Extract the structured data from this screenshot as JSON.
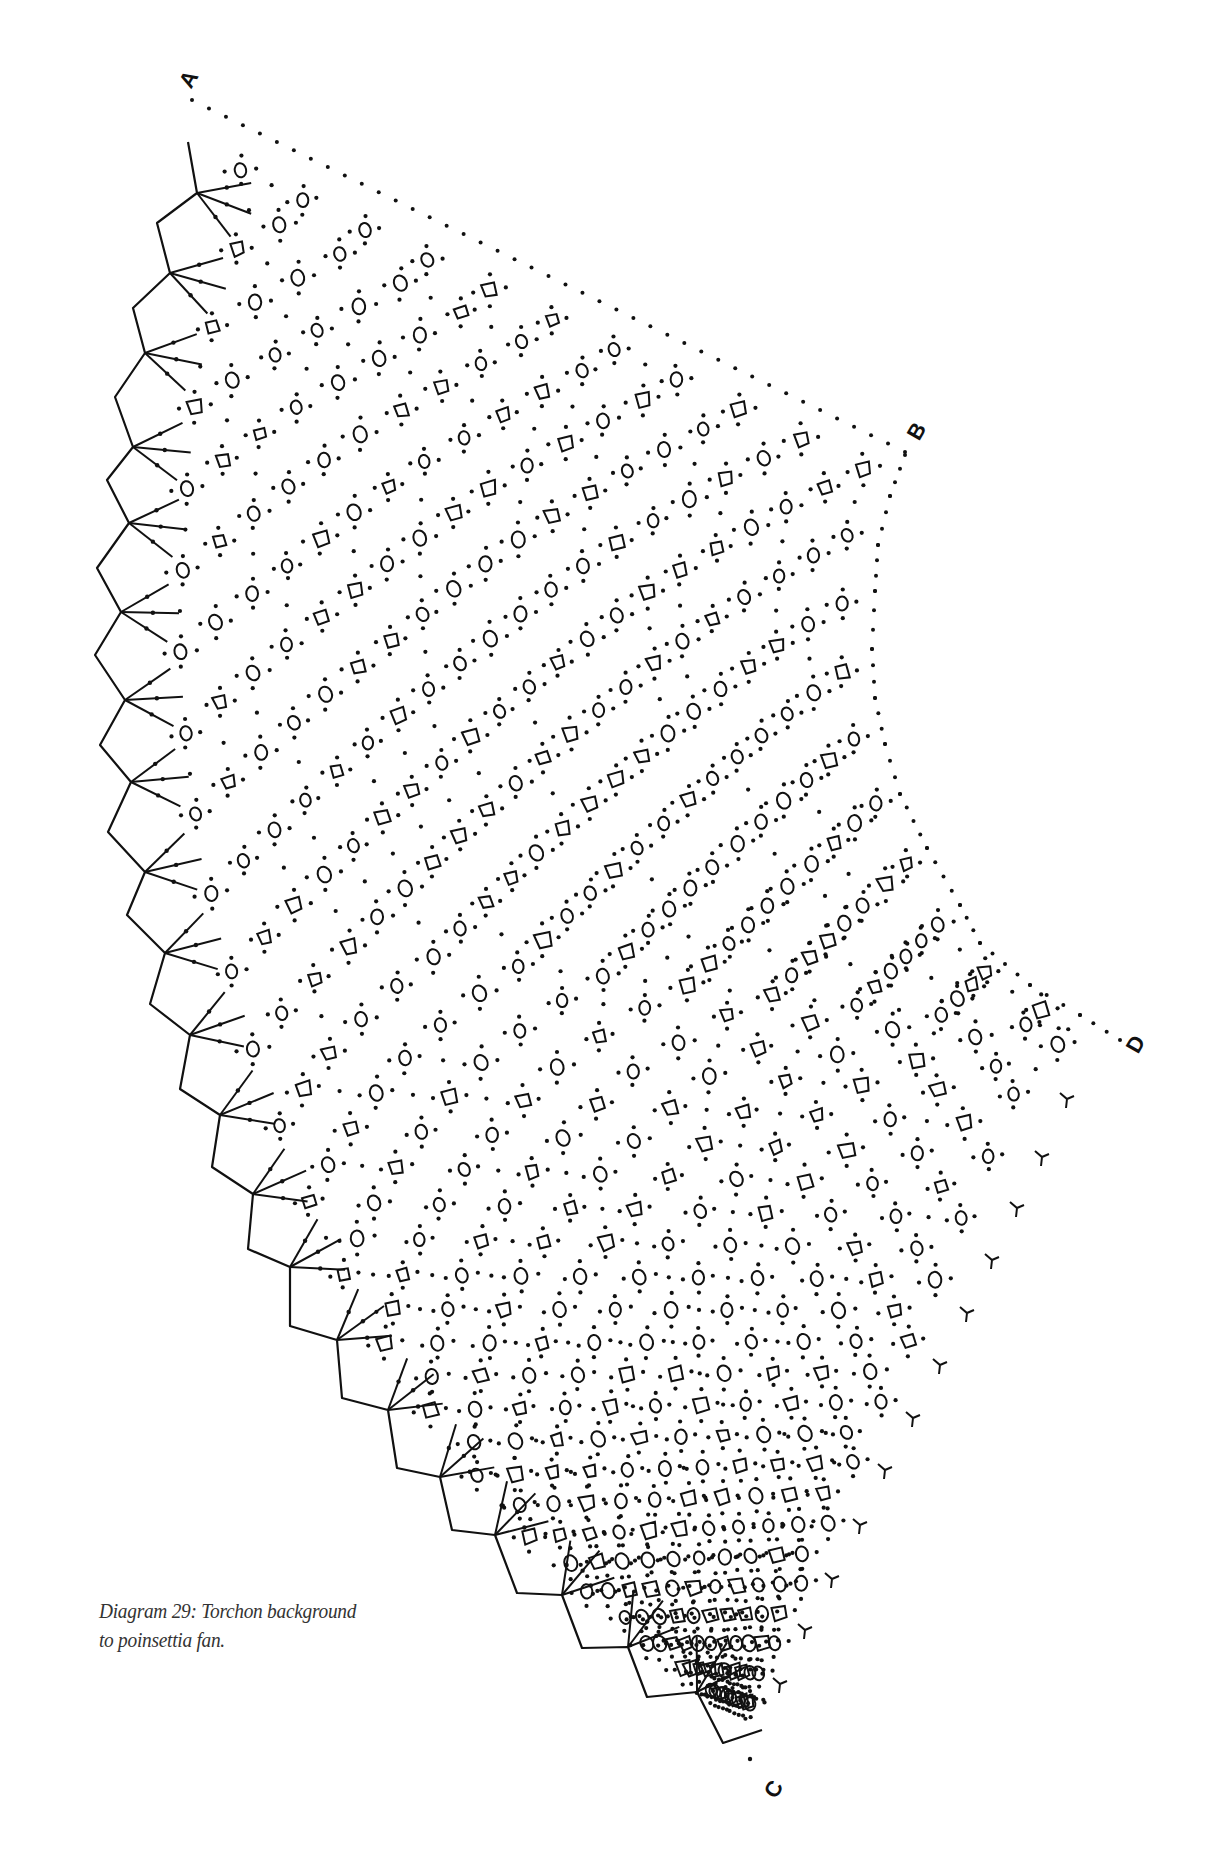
{
  "figure": {
    "caption_line1": "Diagram 29: Torchon background",
    "caption_line2": "to poinsettia fan.",
    "ink_color": "#111111",
    "background": "#ffffff"
  },
  "corner_labels": [
    {
      "id": "A",
      "text": "A",
      "x": 190,
      "y": 80,
      "rotate": -60
    },
    {
      "id": "B",
      "text": "B",
      "x": 918,
      "y": 432,
      "rotate": -60
    },
    {
      "id": "D",
      "text": "D",
      "x": 1137,
      "y": 1045,
      "rotate": -60
    },
    {
      "id": "C",
      "text": "C",
      "x": 775,
      "y": 1790,
      "rotate": -60
    }
  ],
  "left_edge": {
    "picot_tips": [
      [
        197,
        193
      ],
      [
        170,
        273
      ],
      [
        145,
        353
      ],
      [
        133,
        447
      ],
      [
        129,
        523
      ],
      [
        121,
        612
      ],
      [
        125,
        700
      ],
      [
        131,
        782
      ],
      [
        145,
        872
      ],
      [
        165,
        953
      ],
      [
        190,
        1035
      ],
      [
        220,
        1115
      ],
      [
        253,
        1194
      ],
      [
        290,
        1267
      ],
      [
        337,
        1340
      ],
      [
        388,
        1410
      ],
      [
        440,
        1477
      ],
      [
        495,
        1535
      ],
      [
        562,
        1595
      ],
      [
        628,
        1647
      ],
      [
        697,
        1692
      ]
    ],
    "inner_vertices": [
      [
        157,
        223
      ],
      [
        133,
        308
      ],
      [
        115,
        397
      ],
      [
        107,
        480
      ],
      [
        97,
        568
      ],
      [
        95,
        655
      ],
      [
        100,
        745
      ],
      [
        108,
        832
      ],
      [
        127,
        915
      ],
      [
        150,
        1004
      ],
      [
        180,
        1089
      ],
      [
        212,
        1167
      ],
      [
        248,
        1249
      ],
      [
        290,
        1326
      ],
      [
        342,
        1398
      ],
      [
        397,
        1468
      ],
      [
        452,
        1530
      ],
      [
        517,
        1593
      ],
      [
        582,
        1648
      ],
      [
        647,
        1697
      ]
    ],
    "start": [
      188,
      142
    ],
    "end": [
      723,
      1743
    ],
    "tail": [
      762,
      1730
    ],
    "ray_length": 58
  },
  "right_edge": {
    "top_AB": [
      [
        192,
        100
      ],
      [
        905,
        452
      ]
    ],
    "concave_BD": [
      [
        905,
        455
      ],
      [
        890,
        496
      ],
      [
        878,
        545
      ],
      [
        875,
        591
      ],
      [
        872,
        649
      ],
      [
        875,
        698
      ],
      [
        885,
        744
      ],
      [
        900,
        794
      ],
      [
        927,
        848
      ],
      [
        960,
        905
      ],
      [
        980,
        943
      ],
      [
        1030,
        985
      ],
      [
        1080,
        1015
      ],
      [
        1120,
        1040
      ]
    ],
    "edge_DC": [
      [
        1120,
        1045
      ],
      [
        1067,
        1099
      ],
      [
        1042,
        1157
      ],
      [
        1017,
        1208
      ],
      [
        992,
        1260
      ],
      [
        967,
        1313
      ],
      [
        940,
        1365
      ],
      [
        913,
        1418
      ],
      [
        885,
        1470
      ],
      [
        860,
        1525
      ],
      [
        832,
        1579
      ],
      [
        805,
        1630
      ],
      [
        780,
        1684
      ],
      [
        755,
        1735
      ]
    ],
    "y_marks": [
      [
        1067,
        1099
      ],
      [
        1042,
        1157
      ],
      [
        1017,
        1208
      ],
      [
        992,
        1260
      ],
      [
        967,
        1313
      ],
      [
        940,
        1365
      ],
      [
        913,
        1418
      ],
      [
        885,
        1470
      ],
      [
        860,
        1525
      ],
      [
        832,
        1579
      ],
      [
        805,
        1630
      ],
      [
        780,
        1684
      ]
    ]
  },
  "grid": {
    "rows": 44,
    "cols": 22,
    "cell_size": 6.5,
    "dot_radius": 2.1,
    "seed": 29
  },
  "extra_marks": {
    "end_dot": [
      750,
      1759
    ]
  }
}
